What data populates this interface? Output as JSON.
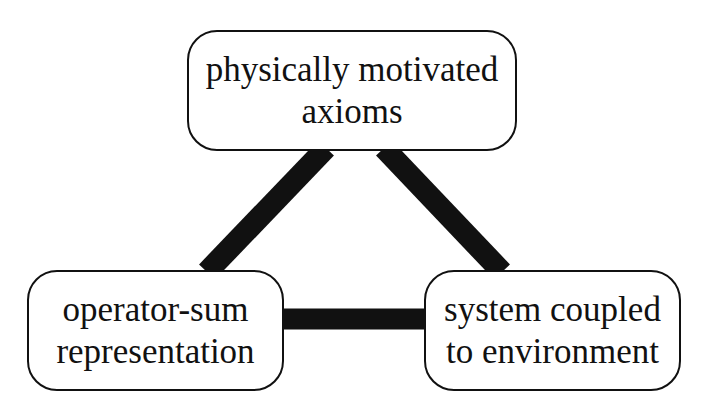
{
  "diagram": {
    "type": "triangle-relationship",
    "nodes": {
      "top": {
        "id": "axioms",
        "lines": [
          "physically motivated",
          "axioms"
        ]
      },
      "left": {
        "id": "operator-sum",
        "lines": [
          "operator-sum",
          "representation"
        ]
      },
      "right": {
        "id": "environment",
        "lines": [
          "system coupled",
          "to environment"
        ]
      }
    },
    "edges": [
      {
        "from": "axioms",
        "to": "operator-sum",
        "style": "thick-line"
      },
      {
        "from": "axioms",
        "to": "environment",
        "style": "thick-line"
      },
      {
        "from": "operator-sum",
        "to": "environment",
        "style": "thick-line"
      }
    ],
    "colors": {
      "stroke": "#111111",
      "background": "#ffffff",
      "fill": "#ffffff"
    }
  }
}
